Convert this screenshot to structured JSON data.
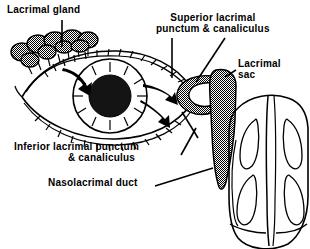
{
  "figure": {
    "type": "anatomical-line-diagram",
    "background_color": "#ffffff",
    "ink_color": "#000000",
    "fill_gray": "#808080"
  },
  "labels": {
    "lacrimal_gland": "Lacrimal gland",
    "superior_punctum_line1": "Superior lacrimal",
    "superior_punctum_line2": "punctum & canaliculus",
    "lacrimal_sac_line1": "Lacrimal",
    "lacrimal_sac_line2": "sac",
    "inferior_punctum_line1": "Inferior lacrimal punctum",
    "inferior_punctum_line2": "& canaliculus",
    "nasolacrimal_duct": "Nasolacrimal duct"
  },
  "structures": {
    "eye": "eye-with-eyelashes",
    "iris": "striated-iris",
    "pupil": "dark-pupil",
    "lacrimal_gland": "lobulated-gland-cluster",
    "lacrimal_sac": "shaded-lacrimal-sac",
    "canaliculi": "shaded-canaliculi-loop",
    "nasolacrimal_duct": "tapering-duct",
    "nose": "nasal-cavity-with-turbinates",
    "tear_flow_arrows": "curved-flow-arrows"
  }
}
